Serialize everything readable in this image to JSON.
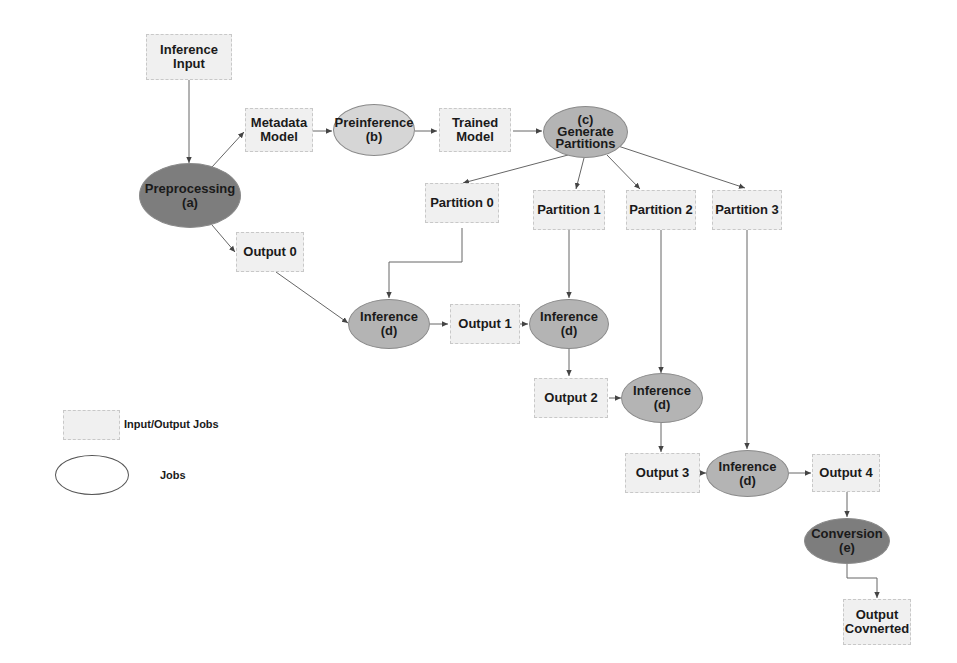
{
  "diagram": {
    "type": "workflow",
    "nodes": {
      "inference_input": {
        "label_line1": "Inference",
        "label_line2": "Input",
        "shape": "box"
      },
      "preprocessing": {
        "label_line1": "Preprocessing",
        "label_line2": "(a)",
        "shape": "ellipse"
      },
      "metadata_model": {
        "label_line1": "Metadata",
        "label_line2": "Model",
        "shape": "box"
      },
      "preinference": {
        "label_line1": "Preinference",
        "label_line2": "(b)",
        "shape": "ellipse"
      },
      "trained_model": {
        "label_line1": "Trained",
        "label_line2": "Model",
        "shape": "box"
      },
      "generate_partitions": {
        "label_line0": "(c)",
        "label_line1": "Generate",
        "label_line2": "Partitions",
        "shape": "ellipse"
      },
      "partition_0": {
        "label": "Partition 0",
        "shape": "box"
      },
      "partition_1": {
        "label": "Partition 1",
        "shape": "box"
      },
      "partition_2": {
        "label": "Partition 2",
        "shape": "box"
      },
      "partition_3": {
        "label": "Partition 3",
        "shape": "box"
      },
      "output_0": {
        "label": "Output 0",
        "shape": "box"
      },
      "inference_1": {
        "label_line1": "Inference",
        "label_line2": "(d)",
        "shape": "ellipse"
      },
      "output_1": {
        "label": "Output 1",
        "shape": "box"
      },
      "inference_2": {
        "label_line1": "Inference",
        "label_line2": "(d)",
        "shape": "ellipse"
      },
      "output_2": {
        "label": "Output 2",
        "shape": "box"
      },
      "inference_3": {
        "label_line1": "Inference",
        "label_line2": "(d)",
        "shape": "ellipse"
      },
      "output_3": {
        "label": "Output 3",
        "shape": "box"
      },
      "inference_4": {
        "label_line1": "Inference",
        "label_line2": "(d)",
        "shape": "ellipse"
      },
      "output_4": {
        "label": "Output 4",
        "shape": "box"
      },
      "conversion": {
        "label_line1": "Conversion",
        "label_line2": "(e)",
        "shape": "ellipse"
      },
      "output_converted": {
        "label_line1": "Output",
        "label_line2": "Covnerted",
        "shape": "box"
      }
    },
    "edges": [
      [
        "inference_input",
        "preprocessing"
      ],
      [
        "preprocessing",
        "metadata_model"
      ],
      [
        "preprocessing",
        "output_0"
      ],
      [
        "metadata_model",
        "preinference"
      ],
      [
        "preinference",
        "trained_model"
      ],
      [
        "trained_model",
        "generate_partitions"
      ],
      [
        "generate_partitions",
        "partition_0"
      ],
      [
        "generate_partitions",
        "partition_1"
      ],
      [
        "generate_partitions",
        "partition_2"
      ],
      [
        "generate_partitions",
        "partition_3"
      ],
      [
        "output_0",
        "inference_1"
      ],
      [
        "partition_0",
        "inference_1"
      ],
      [
        "inference_1",
        "output_1"
      ],
      [
        "output_1",
        "inference_2"
      ],
      [
        "partition_1",
        "inference_2"
      ],
      [
        "inference_2",
        "output_2"
      ],
      [
        "output_2",
        "inference_3"
      ],
      [
        "partition_2",
        "inference_3"
      ],
      [
        "inference_3",
        "output_3"
      ],
      [
        "output_3",
        "inference_4"
      ],
      [
        "partition_3",
        "inference_4"
      ],
      [
        "inference_4",
        "output_4"
      ],
      [
        "output_4",
        "conversion"
      ],
      [
        "conversion",
        "output_converted"
      ]
    ]
  },
  "legend": {
    "box_label": "Input/Output Jobs",
    "ellipse_label": "Jobs"
  },
  "colors": {
    "box_fill": "#f0f0f0",
    "dark_job": "#7d7d7d",
    "mid_job": "#b4b4b4",
    "light_job": "#d6d6d6",
    "edge": "#555555"
  }
}
